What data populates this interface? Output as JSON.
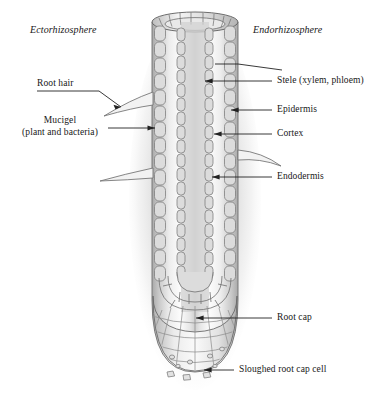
{
  "diagram": {
    "zones": [
      {
        "name": "ectorhizosphere",
        "label": "Ectorhizosphere"
      },
      {
        "name": "endorhizosphere",
        "label": "Endorhizosphere"
      }
    ],
    "labels_left": [
      {
        "name": "root-hair",
        "label": "Root hair"
      },
      {
        "name": "mucigel",
        "label": "Mucigel",
        "label2": "(plant and bacteria)"
      }
    ],
    "labels_right": [
      {
        "name": "stele",
        "label": "Stele (xylem, phloem)"
      },
      {
        "name": "epidermis",
        "label": "Epidermis"
      },
      {
        "name": "cortex",
        "label": "Cortex"
      },
      {
        "name": "endodermis",
        "label": "Endodermis"
      },
      {
        "name": "root-cap",
        "label": "Root cap"
      },
      {
        "name": "sloughed-root-cap-cell",
        "label": "Sloughed root cap cell"
      }
    ],
    "colors": {
      "ink": "#3a3a3a",
      "line": "#2b2b2b",
      "cell_fill": "#d8d8d8",
      "cell_stroke": "#7d7d7d",
      "body_light": "#fbfbfb",
      "body_mid": "#cfcfcf",
      "halo": "#bfbfbf"
    }
  }
}
